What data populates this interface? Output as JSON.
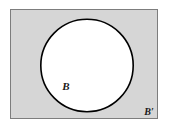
{
  "figure": {
    "type": "venn-diagram",
    "canvas": {
      "width": 169,
      "height": 129,
      "background_color": "#ffffff"
    },
    "universal_set": {
      "name": "universal-set-rectangle",
      "x": 10,
      "y": 9,
      "width": 148,
      "height": 110,
      "fill_color": "#d6d6d6",
      "stroke_color": "#7d7d7d",
      "stroke_width": 1
    },
    "set_circle": {
      "name": "set-b-circle",
      "cx": 87,
      "cy": 65.5,
      "r": 46.5,
      "fill_color": "#ffffff",
      "stroke_color": "#000000",
      "stroke_width": 1.6
    },
    "labels": [
      {
        "name": "label-set-b",
        "text": "B",
        "x": 66,
        "y": 90,
        "region": "inside-circle",
        "color": "#1a1a1a",
        "font_size": 11
      },
      {
        "name": "label-set-b-complement",
        "text": "B′",
        "x": 145,
        "y": 115,
        "region": "shaded-outside-circle",
        "color": "#1a1a1a",
        "font_size": 10
      }
    ]
  }
}
